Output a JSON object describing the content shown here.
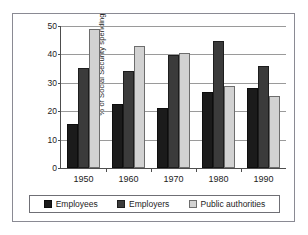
{
  "chart_data": {
    "type": "bar",
    "title": "",
    "xlabel": "",
    "ylabel": "% of Social Security spending",
    "ylim": [
      0,
      50
    ],
    "yticks": [
      0,
      10,
      20,
      30,
      40,
      50
    ],
    "grid": true,
    "legend_position": "bottom",
    "categories": [
      "1950",
      "1960",
      "1970",
      "1980",
      "1990"
    ],
    "series": [
      {
        "name": "Employees",
        "color": "#1b1b1b",
        "values": [
          15.4,
          22.7,
          21.0,
          26.9,
          28.0
        ]
      },
      {
        "name": "Employers",
        "color": "#3b3b3b",
        "values": [
          35.3,
          34.3,
          39.9,
          44.8,
          36.0
        ]
      },
      {
        "name": "Public authorities",
        "color": "#d2d2d2",
        "values": [
          49.0,
          43.0,
          40.5,
          29.0,
          25.5
        ]
      }
    ]
  }
}
